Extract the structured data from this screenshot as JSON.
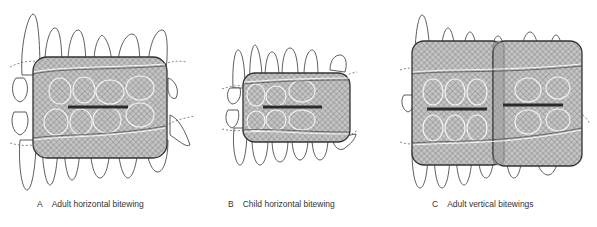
{
  "figure": {
    "panels": [
      {
        "id": "A",
        "letter": "A",
        "label": "Adult horizontal bitewing",
        "films": [
          {
            "x": 33,
            "y": 57,
            "w": 134,
            "h": 101,
            "rx": 14
          }
        ],
        "bite_tabs": [
          {
            "x1": 68,
            "x2": 128,
            "y": 107
          }
        ]
      },
      {
        "id": "B",
        "letter": "B",
        "label": "Child horizontal bitewing",
        "films": [
          {
            "x": 243,
            "y": 73,
            "w": 107,
            "h": 69,
            "rx": 12
          }
        ],
        "bite_tabs": [
          {
            "x1": 263,
            "x2": 322,
            "y": 107
          }
        ]
      },
      {
        "id": "C",
        "letter": "C",
        "label": "Adult vertical bitewings",
        "films": [
          {
            "x": 412,
            "y": 41,
            "w": 92,
            "h": 124,
            "rx": 12
          },
          {
            "x": 493,
            "y": 41,
            "w": 89,
            "h": 125,
            "rx": 12
          }
        ],
        "bite_tabs": [
          {
            "x1": 427,
            "x2": 487,
            "y": 109
          },
          {
            "x1": 503,
            "x2": 563,
            "y": 105
          }
        ]
      }
    ],
    "colors": {
      "film_fill": "#b9b9b9",
      "film_stroke": "#333333",
      "bite_tab": "#2b2b2b",
      "tooth_outline": "#333333",
      "background": "#ffffff"
    }
  }
}
